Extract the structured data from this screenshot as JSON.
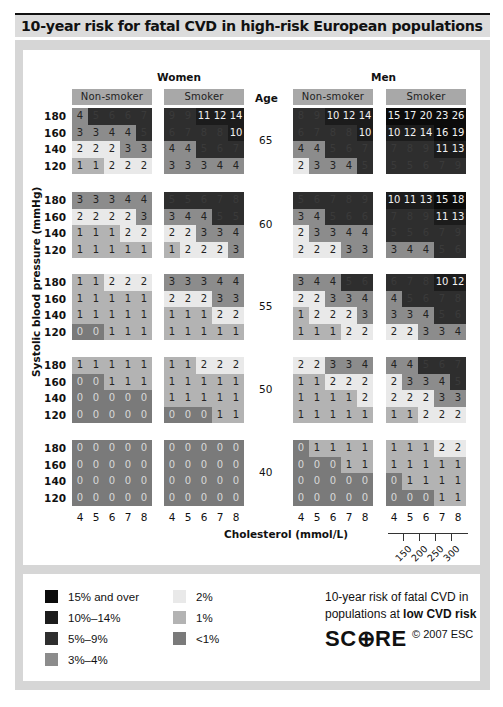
{
  "title": "10-year risk for fatal CVD in high-risk European populations",
  "labels": {
    "women": "Women",
    "men": "Men",
    "non_smoker": "Non-smoker",
    "smoker": "Smoker",
    "age": "Age",
    "y_axis": "Systolic blood pressure (mmHg)",
    "x_axis": "Cholesterol (mmol/L)"
  },
  "colors": {
    "15_and_over": "#0b0b0b",
    "10_14": "#1c1c1c",
    "5_9": "#2e2e2e",
    "3_4": "#8c8c8c",
    "2": "#e9e9e9",
    "1": "#b3b3b3",
    "lt1": "#7a7a7a"
  },
  "chart_data": {
    "type": "heatmap",
    "title": "10-year risk for fatal CVD in high-risk European populations",
    "xlabel": "Cholesterol (mmol/L)",
    "ylabel": "Systolic blood pressure (mmHg)",
    "cholesterol_mmol": [
      "4",
      "5",
      "6",
      "7",
      "8"
    ],
    "cholesterol_mgdl": [
      "150",
      "200",
      "250",
      "300"
    ],
    "sbp": [
      "180",
      "160",
      "140",
      "120"
    ],
    "ages": [
      "65",
      "60",
      "55",
      "50",
      "40"
    ],
    "panels": {
      "women_non_smoker": [
        [
          [
            4,
            5,
            6,
            6,
            7
          ],
          [
            3,
            3,
            4,
            4,
            5
          ],
          [
            2,
            2,
            2,
            3,
            3
          ],
          [
            1,
            1,
            2,
            2,
            2
          ]
        ],
        [
          [
            3,
            3,
            3,
            4,
            4
          ],
          [
            2,
            2,
            2,
            2,
            3
          ],
          [
            1,
            1,
            1,
            2,
            2
          ],
          [
            1,
            1,
            1,
            1,
            1
          ]
        ],
        [
          [
            1,
            1,
            2,
            2,
            2
          ],
          [
            1,
            1,
            1,
            1,
            1
          ],
          [
            1,
            1,
            1,
            1,
            1
          ],
          [
            0,
            0,
            1,
            1,
            1
          ]
        ],
        [
          [
            1,
            1,
            1,
            1,
            1
          ],
          [
            0,
            0,
            1,
            1,
            1
          ],
          [
            0,
            0,
            0,
            0,
            0
          ],
          [
            0,
            0,
            0,
            0,
            0
          ]
        ],
        [
          [
            0,
            0,
            0,
            0,
            0
          ],
          [
            0,
            0,
            0,
            0,
            0
          ],
          [
            0,
            0,
            0,
            0,
            0
          ],
          [
            0,
            0,
            0,
            0,
            0
          ]
        ]
      ],
      "women_smoker": [
        [
          [
            9,
            9,
            11,
            12,
            14
          ],
          [
            6,
            7,
            8,
            8,
            10
          ],
          [
            4,
            4,
            5,
            6,
            7
          ],
          [
            3,
            3,
            3,
            4,
            4
          ]
        ],
        [
          [
            5,
            5,
            6,
            7,
            8
          ],
          [
            3,
            4,
            4,
            5,
            5
          ],
          [
            2,
            2,
            3,
            3,
            4
          ],
          [
            1,
            2,
            2,
            2,
            3
          ]
        ],
        [
          [
            3,
            3,
            3,
            4,
            4
          ],
          [
            2,
            2,
            2,
            3,
            3
          ],
          [
            1,
            1,
            1,
            2,
            2
          ],
          [
            1,
            1,
            1,
            1,
            1
          ]
        ],
        [
          [
            1,
            1,
            2,
            2,
            2
          ],
          [
            1,
            1,
            1,
            1,
            1
          ],
          [
            1,
            1,
            1,
            1,
            1
          ],
          [
            0,
            0,
            0,
            1,
            1
          ]
        ],
        [
          [
            0,
            0,
            0,
            0,
            0
          ],
          [
            0,
            0,
            0,
            0,
            0
          ],
          [
            0,
            0,
            0,
            0,
            0
          ],
          [
            0,
            0,
            0,
            0,
            0
          ]
        ]
      ],
      "men_non_smoker": [
        [
          [
            8,
            9,
            10,
            12,
            14
          ],
          [
            6,
            7,
            8,
            8,
            10
          ],
          [
            4,
            4,
            5,
            6,
            7
          ],
          [
            2,
            3,
            3,
            4,
            5
          ]
        ],
        [
          [
            5,
            6,
            7,
            8,
            9
          ],
          [
            3,
            4,
            5,
            6,
            6
          ],
          [
            2,
            3,
            3,
            4,
            4
          ],
          [
            2,
            2,
            2,
            3,
            3
          ]
        ],
        [
          [
            3,
            4,
            4,
            5,
            6
          ],
          [
            2,
            2,
            3,
            3,
            4
          ],
          [
            1,
            2,
            2,
            2,
            3
          ],
          [
            1,
            1,
            1,
            2,
            2
          ]
        ],
        [
          [
            2,
            2,
            3,
            3,
            4
          ],
          [
            1,
            1,
            2,
            2,
            2
          ],
          [
            1,
            1,
            1,
            1,
            2
          ],
          [
            1,
            1,
            1,
            1,
            1
          ]
        ],
        [
          [
            0,
            1,
            1,
            1,
            1
          ],
          [
            0,
            0,
            0,
            1,
            1
          ],
          [
            0,
            0,
            0,
            0,
            0
          ],
          [
            0,
            0,
            0,
            0,
            0
          ]
        ]
      ],
      "men_smoker": [
        [
          [
            15,
            17,
            20,
            23,
            26
          ],
          [
            10,
            12,
            14,
            16,
            19
          ],
          [
            7,
            8,
            9,
            11,
            13
          ],
          [
            5,
            5,
            6,
            7,
            9
          ]
        ],
        [
          [
            10,
            11,
            13,
            15,
            18
          ],
          [
            7,
            8,
            9,
            11,
            13
          ],
          [
            5,
            5,
            6,
            7,
            9
          ],
          [
            3,
            4,
            4,
            5,
            6
          ]
        ],
        [
          [
            6,
            7,
            8,
            10,
            12
          ],
          [
            4,
            5,
            6,
            7,
            8
          ],
          [
            3,
            3,
            4,
            5,
            6
          ],
          [
            2,
            2,
            3,
            3,
            4
          ]
        ],
        [
          [
            4,
            4,
            5,
            6,
            7
          ],
          [
            2,
            3,
            3,
            4,
            5
          ],
          [
            2,
            2,
            2,
            3,
            3
          ],
          [
            1,
            1,
            2,
            2,
            2
          ]
        ],
        [
          [
            1,
            1,
            1,
            2,
            2
          ],
          [
            1,
            1,
            1,
            1,
            1
          ],
          [
            0,
            1,
            1,
            1,
            1
          ],
          [
            0,
            0,
            0,
            1,
            1
          ]
        ]
      ]
    },
    "legend": [
      "15% and over",
      "10%–14%",
      "5%–9%",
      "3%–4%",
      "2%",
      "1%",
      "<1%"
    ]
  },
  "legend": {
    "items": [
      {
        "label": "15% and over",
        "color": "#0b0b0b"
      },
      {
        "label": "10%–14%",
        "color": "#1c1c1c"
      },
      {
        "label": "5%–9%",
        "color": "#2e2e2e"
      },
      {
        "label": "3%–4%",
        "color": "#8c8c8c"
      },
      {
        "label": "2%",
        "color": "#e9e9e9"
      },
      {
        "label": "1%",
        "color": "#b3b3b3"
      },
      {
        "label": "<1%",
        "color": "#7a7a7a"
      }
    ],
    "note_line1": "10-year risk of fatal CVD in",
    "note_line2_prefix": "populations at ",
    "note_line2_bold": "low CVD risk",
    "logo": "SC⊕RE",
    "copyright": "© 2007 ESC"
  }
}
